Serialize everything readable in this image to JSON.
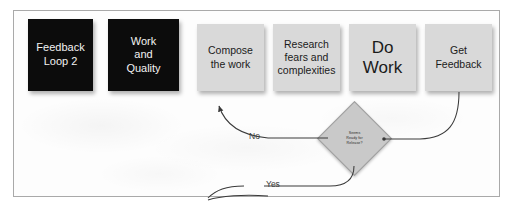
{
  "slide": {
    "background_color": "#fdfdfd",
    "border_color": "#a9a9a9"
  },
  "palette": {
    "dark_node_fill": "#0c0c0c",
    "dark_node_text": "#f2f2f2",
    "light_node_fill": "#d9d9d9",
    "light_node_text": "#1b1b1b",
    "diamond_fill": "#c9c9c9",
    "connector_stroke": "#3a3a3a"
  },
  "nodes": [
    {
      "id": "feedback-loop-2",
      "label": "Feedback\nLoop 2",
      "style": "dark"
    },
    {
      "id": "work-and-quality",
      "label": "Work\nand\nQuality",
      "style": "dark"
    },
    {
      "id": "compose-the-work",
      "label": "Compose\nthe work",
      "style": "light"
    },
    {
      "id": "research-fears",
      "label": "Research\nfears and\ncomplexities",
      "style": "light"
    },
    {
      "id": "do-work",
      "label": "Do\nWork",
      "style": "light-emphasis"
    },
    {
      "id": "get-feedback",
      "label": "Get\nFeedback",
      "style": "light"
    }
  ],
  "decision": {
    "id": "seems-ready-for-release",
    "label": "Seems\nReady for\nRelease?"
  },
  "connectors": {
    "no_label": "No",
    "yes_label": "Yes"
  }
}
